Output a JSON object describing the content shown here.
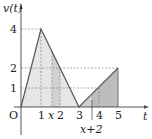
{
  "diagram": {
    "y_axis_label": "v(t)",
    "x_axis_label": "t",
    "origin_label": "O",
    "y_ticks": [
      "4",
      "2",
      "1"
    ],
    "x_ticks": [
      "1",
      "x",
      "2",
      "3",
      "4",
      "5"
    ],
    "x_plus_label": "x+2",
    "graph_points": [
      [
        0,
        0
      ],
      [
        1,
        4
      ],
      [
        3,
        0
      ],
      [
        5,
        2
      ]
    ],
    "shaded_regions": [
      {
        "from": 0,
        "to": 3,
        "shade": "light"
      },
      {
        "from": "x",
        "to": 2,
        "shade": "medium"
      },
      {
        "from": 3,
        "to": "x+2",
        "shade": "medium"
      },
      {
        "from": "x+2",
        "to": 5,
        "shade": "dark"
      }
    ],
    "colors": {
      "light": "#e3e3e3",
      "medium": "#cfcfcf",
      "dark": "#bdbdbd",
      "line": "#555555"
    }
  }
}
